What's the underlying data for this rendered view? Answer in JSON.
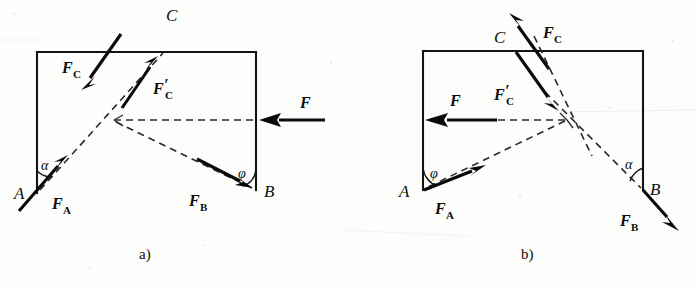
{
  "figure": {
    "background_color": "#fdfdfb",
    "ink_color": "#0d0d0d",
    "panels": [
      {
        "id": "panel-a",
        "caption": "a)",
        "caption_pos": {
          "x": 145,
          "y": 258
        },
        "frame": {
          "name": "bracket-outline-a",
          "points": "37,52 256,52 256,190 37,193",
          "visible_edges": [
            {
              "name": "top-edge-a",
              "from": [
                37,
                52
              ],
              "to": [
                256,
                52
              ]
            },
            {
              "name": "right-edge-a",
              "from": [
                256,
                52
              ],
              "to": [
                256,
                190
              ]
            },
            {
              "name": "left-edge-a",
              "from": [
                37,
                52
              ],
              "to": [
                37,
                193
              ]
            }
          ]
        },
        "points": [
          {
            "name": "point-A",
            "label": "A",
            "x": 37,
            "y": 193,
            "label_x": 14,
            "label_y": 198
          },
          {
            "name": "point-B",
            "label": "B",
            "x": 256,
            "y": 190,
            "label_x": 264,
            "label_y": 197
          },
          {
            "name": "point-C",
            "label": "C",
            "x": 163,
            "y": 52,
            "label_x": 167,
            "label_y": 20
          },
          {
            "name": "node-O",
            "label": "",
            "x": 114,
            "y": 120
          }
        ],
        "dashed_lines": [
          {
            "name": "dashed-AC",
            "from": [
              37,
              193
            ],
            "to": [
              163,
              52
            ]
          },
          {
            "name": "dashed-O-right",
            "from": [
              114,
              120
            ],
            "to": [
              256,
              120
            ]
          },
          {
            "name": "dashed-OB",
            "from": [
              114,
              120
            ],
            "to": [
              256,
              190
            ]
          }
        ],
        "vectors": [
          {
            "name": "vector-FC",
            "label": "F",
            "sublabel": "C",
            "prime": false,
            "from": [
              120,
              35
            ],
            "to": [
              82,
              88
            ],
            "label_x": 63,
            "label_y": 73
          },
          {
            "name": "vector-FC-prime",
            "label": "F",
            "sublabel": "C",
            "prime": true,
            "from": [
              122,
              108
            ],
            "to": [
              158,
              57
            ],
            "label_x": 155,
            "label_y": 94
          },
          {
            "name": "vector-FA",
            "label": "F",
            "sublabel": "A",
            "prime": false,
            "from": [
              19,
              210
            ],
            "to": [
              67,
              155
            ],
            "label_x": 53,
            "label_y": 208
          },
          {
            "name": "vector-FB",
            "label": "F",
            "sublabel": "B",
            "prime": false,
            "from": [
              198,
              160
            ],
            "to": [
              252,
              188
            ],
            "label_x": 190,
            "label_y": 205
          },
          {
            "name": "vector-F",
            "label": "F",
            "sublabel": "",
            "prime": false,
            "from": [
              324,
              120
            ],
            "to": [
              260,
              120
            ],
            "label_x": 302,
            "label_y": 108
          }
        ],
        "angles": [
          {
            "name": "angle-alpha-a",
            "label": "α",
            "vertex": [
              37,
              193
            ],
            "label_x": 43,
            "label_y": 168
          },
          {
            "name": "angle-phi-a",
            "label": "φ",
            "vertex": [
              256,
              190
            ],
            "label_x": 239,
            "label_y": 177
          }
        ]
      },
      {
        "id": "panel-b",
        "caption": "b)",
        "caption_pos": {
          "x": 527,
          "y": 258
        },
        "frame": {
          "name": "bracket-outline-b",
          "points": "423,51 643,51 643,190 423,190",
          "visible_edges": [
            {
              "name": "top-edge-b",
              "from": [
                423,
                51
              ],
              "to": [
                643,
                51
              ]
            },
            {
              "name": "right-edge-b",
              "from": [
                643,
                51
              ],
              "to": [
                643,
                190
              ]
            },
            {
              "name": "left-edge-b",
              "from": [
                423,
                51
              ],
              "to": [
                423,
                190
              ]
            }
          ]
        },
        "points": [
          {
            "name": "point-A",
            "label": "A",
            "x": 423,
            "y": 190,
            "label_x": 400,
            "label_y": 196
          },
          {
            "name": "point-B",
            "label": "B",
            "x": 643,
            "y": 190,
            "label_x": 651,
            "label_y": 194
          },
          {
            "name": "point-C",
            "label": "C",
            "x": 516,
            "y": 51,
            "label_x": 496,
            "label_y": 42
          },
          {
            "name": "node-O",
            "label": "",
            "x": 567,
            "y": 120
          }
        ],
        "dashed_lines": [
          {
            "name": "dashed-CO-extended",
            "from": [
              530,
              30
            ],
            "to": [
              590,
              152
            ]
          },
          {
            "name": "dashed-O-left",
            "from": [
              567,
              120
            ],
            "to": [
              487,
              120
            ]
          },
          {
            "name": "dashed-OA",
            "from": [
              567,
              120
            ],
            "to": [
              423,
              190
            ]
          },
          {
            "name": "dashed-OB-extended",
            "from": [
              544,
              90
            ],
            "to": [
              643,
              190
            ]
          }
        ],
        "vectors": [
          {
            "name": "vector-FC",
            "label": "F",
            "sublabel": "C",
            "prime": false,
            "from": [
              548,
              68
            ],
            "to": [
              510,
              14
            ],
            "label_x": 545,
            "label_y": 38
          },
          {
            "name": "vector-FC-prime",
            "label": "F",
            "sublabel": "C",
            "prime": true,
            "from": [
              516,
              51
            ],
            "to": [
              558,
              110
            ],
            "label_x": 496,
            "label_y": 100
          },
          {
            "name": "vector-FA",
            "label": "F",
            "sublabel": "A",
            "prime": false,
            "from": [
              424,
              190
            ],
            "to": [
              484,
              166
            ],
            "label_x": 436,
            "label_y": 213
          },
          {
            "name": "vector-FB",
            "label": "F",
            "sublabel": "B",
            "prime": false,
            "from": [
              643,
              190
            ],
            "to": [
              677,
              228
            ],
            "label_x": 622,
            "label_y": 225
          },
          {
            "name": "vector-F",
            "label": "F",
            "sublabel": "",
            "prime": false,
            "from": [
              496,
              120
            ],
            "to": [
              425,
              120
            ],
            "label_x": 452,
            "label_y": 106
          }
        ],
        "angles": [
          {
            "name": "angle-phi-b",
            "label": "φ",
            "vertex": [
              423,
              190
            ],
            "label_x": 431,
            "label_y": 177
          },
          {
            "name": "angle-alpha-b",
            "label": "α",
            "vertex": [
              643,
              190
            ],
            "label_x": 627,
            "label_y": 168
          }
        ]
      }
    ]
  }
}
